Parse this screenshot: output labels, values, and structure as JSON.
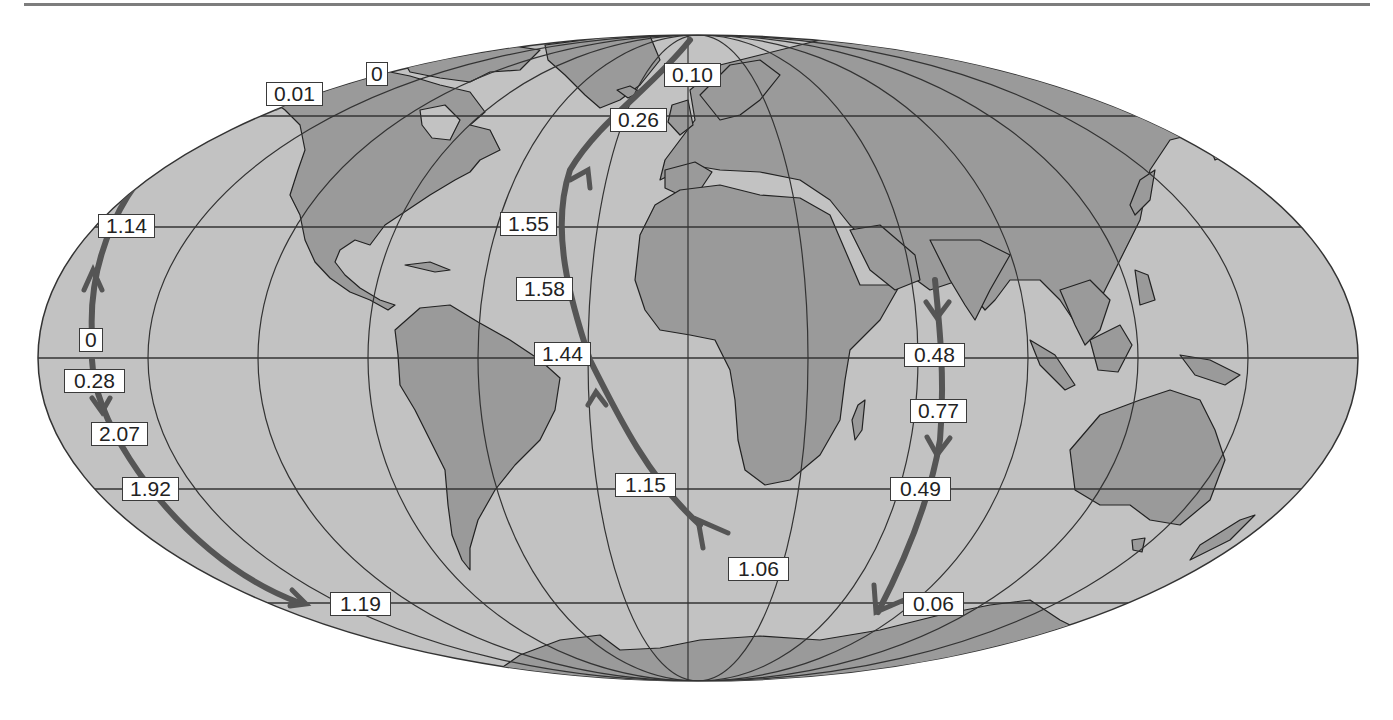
{
  "map": {
    "projection": "Mollweide (world)",
    "colors": {
      "ocean": "#c2c2c2",
      "land": "#9a9a9a",
      "grid": "#333333",
      "arrow": "#555555",
      "label_bg": "#ffffff",
      "background": "#ffffff"
    },
    "flows": [
      {
        "id": "pacific-east",
        "description": "Eastern Pacific flow, northward then southward",
        "labels": [
          "0.01",
          "0",
          "1.14",
          "0",
          "0.28",
          "2.07",
          "1.92",
          "1.19"
        ]
      },
      {
        "id": "atlantic",
        "description": "Atlantic overturning flow, northward",
        "labels": [
          "0.10",
          "0.26",
          "1.55",
          "1.58",
          "1.44",
          "1.15",
          "1.06"
        ]
      },
      {
        "id": "indian",
        "description": "Indian Ocean flow, southward",
        "labels": [
          "0.48",
          "0.77",
          "0.49",
          "0.06"
        ]
      }
    ]
  },
  "labels": {
    "l001": "0.01",
    "l0top": "0",
    "l010": "0.10",
    "l026": "0.26",
    "l114": "1.14",
    "l155": "1.55",
    "l158": "1.58",
    "l0eq": "0",
    "l144": "1.44",
    "l028": "0.28",
    "l048": "0.48",
    "l207": "2.07",
    "l077": "0.77",
    "l192": "1.92",
    "l115": "1.15",
    "l049": "0.49",
    "l106": "1.06",
    "l119": "1.19",
    "l006": "0.06"
  }
}
